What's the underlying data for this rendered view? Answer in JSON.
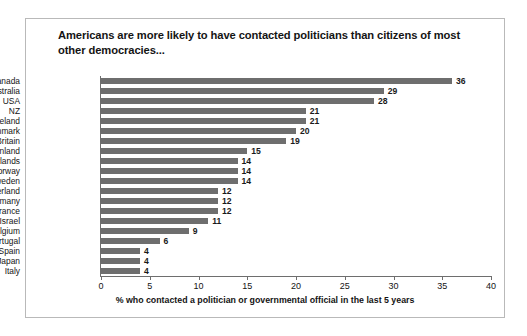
{
  "chart": {
    "title": "Americans are more likely to have contacted politicians than citizens of most other democracies..."
  },
  "chart_data": {
    "type": "bar",
    "orientation": "horizontal",
    "title": "Americans are more likely to have contacted politicians than citizens of most other democracies...",
    "xlabel": "% who contacted a politician or governmental official in the last 5 years",
    "ylabel": "",
    "categories": [
      "Canada",
      "Australia",
      "USA",
      "NZ",
      "Ireland",
      "Denmark",
      "Britain",
      "Finland",
      "Netherlands",
      "Norway",
      "Sweden",
      "Switzerland",
      "Germany",
      "France",
      "Israel",
      "Belgium",
      "Portugal",
      "Spain",
      "Japan",
      "Italy"
    ],
    "values": [
      36,
      29,
      28,
      21,
      21,
      20,
      19,
      15,
      14,
      14,
      14,
      12,
      12,
      12,
      11,
      9,
      6,
      4,
      4,
      4
    ],
    "xlim": [
      0,
      40
    ],
    "xticks": [
      0,
      5,
      10,
      15,
      20,
      25,
      30,
      35,
      40
    ],
    "xtick_labels": [
      "0",
      "5",
      "10",
      "15",
      "20",
      "25",
      "30",
      "35",
      "40"
    ],
    "grid": false,
    "legend": false,
    "bar_color": "#6e6e6e",
    "data_labels": true
  }
}
